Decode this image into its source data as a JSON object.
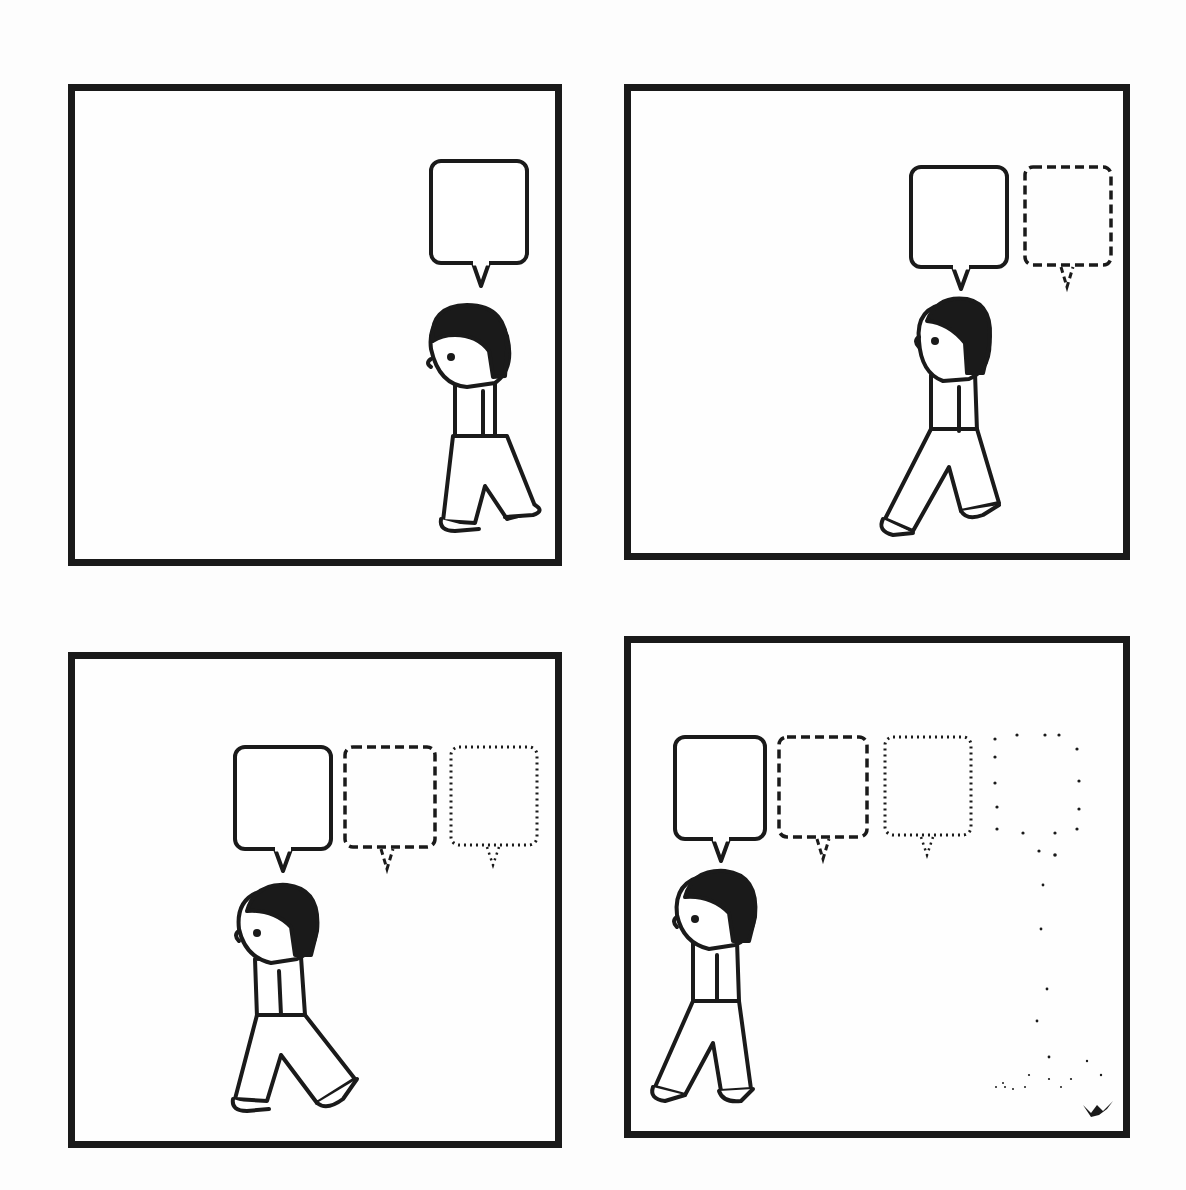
{
  "comic": {
    "title": "",
    "panel_count": 4,
    "colors": {
      "ink": "#1a1a1a",
      "paper": "#fdfdfd"
    },
    "panels": [
      {
        "id": 1,
        "position": "top-left",
        "bubbles": [
          {
            "style": "solid",
            "text": ""
          }
        ],
        "character_direction": "left",
        "character_pose": "walking, head down"
      },
      {
        "id": 2,
        "position": "top-right",
        "bubbles": [
          {
            "style": "solid",
            "text": ""
          },
          {
            "style": "dashed",
            "text": ""
          }
        ],
        "character_direction": "left",
        "character_pose": "walking, head up"
      },
      {
        "id": 3,
        "position": "bottom-left",
        "bubbles": [
          {
            "style": "solid",
            "text": ""
          },
          {
            "style": "dashed",
            "text": ""
          },
          {
            "style": "dotted",
            "text": ""
          }
        ],
        "character_direction": "left",
        "character_pose": "walking"
      },
      {
        "id": 4,
        "position": "bottom-right",
        "bubbles": [
          {
            "style": "solid",
            "text": ""
          },
          {
            "style": "dashed",
            "text": ""
          },
          {
            "style": "dotted",
            "text": ""
          },
          {
            "style": "sparse-dots",
            "text": ""
          }
        ],
        "character_direction": "left",
        "character_pose": "walking",
        "extra": "trail of scattered dots leading down to the floor"
      }
    ],
    "signature": "artist signature glyph"
  }
}
